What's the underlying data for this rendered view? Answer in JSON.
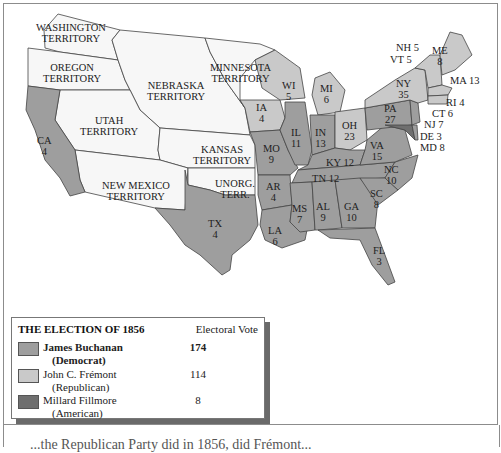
{
  "colors": {
    "democrat": "#9e9e9e",
    "republican": "#c9c9c9",
    "american": "#6f6f6f",
    "territory": "#f7f7f7",
    "border": "#444444",
    "water": "#ffffff"
  },
  "territories": [
    {
      "name": "WASHINGTON\nTERRITORY",
      "line1": "WASHINGTON",
      "line2": "TERRITORY"
    },
    {
      "name": "OREGON TERRITORY",
      "line1": "OREGON",
      "line2": "TERRITORY"
    },
    {
      "name": "NEBRASKA TERRITORY",
      "line1": "NEBRASKA",
      "line2": "TERRITORY"
    },
    {
      "name": "MINNESOTA TERRITORY",
      "line1": "MINNESOTA",
      "line2": "TERRITORY"
    },
    {
      "name": "UTAH TERRITORY",
      "line1": "UTAH",
      "line2": "TERRITORY"
    },
    {
      "name": "KANSAS TERRITORY",
      "line1": "KANSAS",
      "line2": "TERRITORY"
    },
    {
      "name": "NEW MEXICO TERRITORY",
      "line1": "NEW MEXICO",
      "line2": "TERRITORY"
    },
    {
      "name": "UNORG. TERR.",
      "line1": "UNORG.",
      "line2": "TERR."
    }
  ],
  "states": {
    "CA": {
      "abbr": "CA",
      "votes": "4",
      "party": "democrat"
    },
    "TX": {
      "abbr": "TX",
      "votes": "4",
      "party": "democrat"
    },
    "IA": {
      "abbr": "IA",
      "votes": "4",
      "party": "republican"
    },
    "MO": {
      "abbr": "MO",
      "votes": "9",
      "party": "democrat"
    },
    "AR": {
      "abbr": "AR",
      "votes": "4",
      "party": "democrat"
    },
    "LA": {
      "abbr": "LA",
      "votes": "6",
      "party": "democrat"
    },
    "WI": {
      "abbr": "WI",
      "votes": "5",
      "party": "republican"
    },
    "MI": {
      "abbr": "MI",
      "votes": "6",
      "party": "republican"
    },
    "IL": {
      "abbr": "IL",
      "votes": "11",
      "party": "democrat"
    },
    "IN": {
      "abbr": "IN",
      "votes": "13",
      "party": "democrat"
    },
    "OH": {
      "abbr": "OH",
      "votes": "23",
      "party": "republican"
    },
    "KY": {
      "abbr": "KY",
      "votes": "12",
      "party": "democrat"
    },
    "TN": {
      "abbr": "TN",
      "votes": "12",
      "party": "democrat"
    },
    "MS": {
      "abbr": "MS",
      "votes": "7",
      "party": "democrat"
    },
    "AL": {
      "abbr": "AL",
      "votes": "9",
      "party": "democrat"
    },
    "GA": {
      "abbr": "GA",
      "votes": "10",
      "party": "democrat"
    },
    "FL": {
      "abbr": "FL",
      "votes": "3",
      "party": "democrat"
    },
    "SC": {
      "abbr": "SC",
      "votes": "8",
      "party": "democrat"
    },
    "NC": {
      "abbr": "NC",
      "votes": "10",
      "party": "democrat"
    },
    "VA": {
      "abbr": "VA",
      "votes": "15",
      "party": "democrat"
    },
    "PA": {
      "abbr": "PA",
      "votes": "27",
      "party": "democrat"
    },
    "NY": {
      "abbr": "NY",
      "votes": "35",
      "party": "republican"
    },
    "ME": {
      "abbr": "ME",
      "votes": "8",
      "party": "republican"
    },
    "NH": {
      "label": "NH 5",
      "party": "republican"
    },
    "VT": {
      "label": "VT 5",
      "party": "republican"
    },
    "MA": {
      "label": "MA 13",
      "party": "republican"
    },
    "RI": {
      "label": "RI 4",
      "party": "republican"
    },
    "CT": {
      "label": "CT 6",
      "party": "republican"
    },
    "NJ": {
      "label": "NJ 7",
      "party": "democrat"
    },
    "DE": {
      "label": "DE 3",
      "party": "democrat"
    },
    "MD": {
      "label": "MD 8",
      "party": "american"
    }
  },
  "legend": {
    "title": "THE ELECTION OF 1856",
    "column_header": "Electoral Vote",
    "entries": [
      {
        "candidate": "James Buchanan",
        "party": "(Democrat)",
        "votes": "174",
        "color": "#9e9e9e"
      },
      {
        "candidate": "John C. Frémont",
        "party": "(Republican)",
        "votes": "114",
        "color": "#c9c9c9"
      },
      {
        "candidate": "Millard Fillmore",
        "party": "(American)",
        "votes": "8",
        "color": "#6f6f6f"
      }
    ]
  },
  "caption": {
    "text": "...the Republican Party did in 1856, did Frémont..."
  }
}
